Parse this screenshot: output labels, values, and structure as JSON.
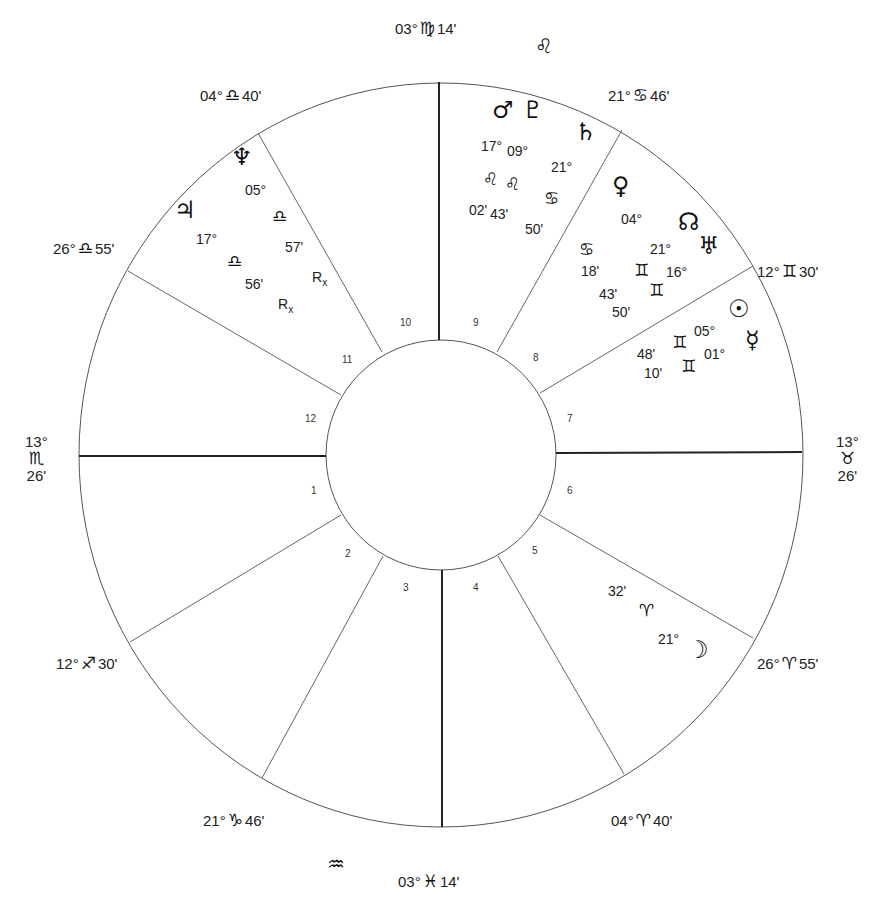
{
  "chart": {
    "type": "natal-wheel",
    "center": {
      "x": 441,
      "y": 455
    },
    "outer_radius": {
      "rx": 362,
      "ry": 372
    },
    "inner_radius": 115,
    "line_color": "#555555",
    "axis_color": "#222222"
  },
  "cusps": [
    {
      "id": "mc",
      "label_deg": "03°",
      "sign": "♍",
      "label_min": "14'",
      "x": 395,
      "y": 20
    },
    {
      "id": "c9",
      "label_deg": "21°",
      "sign": "♋",
      "label_min": "46'",
      "x": 608,
      "y": 87
    },
    {
      "id": "c8",
      "label_deg": "12°",
      "sign": "♊",
      "label_min": "30'",
      "x": 757,
      "y": 263
    },
    {
      "id": "desc",
      "label_deg": "13°",
      "sign": "♉",
      "label_min": "26'",
      "x": 836,
      "y": 433
    },
    {
      "id": "c6",
      "label_deg": "26°",
      "sign": "♈",
      "label_min": "55'",
      "x": 757,
      "y": 655
    },
    {
      "id": "c5",
      "label_deg": "04°",
      "sign": "♈",
      "label_min": "40'",
      "x": 611,
      "y": 812
    },
    {
      "id": "ic",
      "label_deg": "03°",
      "sign": "♓",
      "label_min": "14'",
      "x": 398,
      "y": 873
    },
    {
      "id": "c3",
      "label_deg": "21°",
      "sign": "♑",
      "label_min": "46'",
      "x": 203,
      "y": 812
    },
    {
      "id": "c2",
      "label_deg": "12°",
      "sign": "♐",
      "label_min": "30'",
      "x": 56,
      "y": 655
    },
    {
      "id": "asc",
      "label_deg": "13°",
      "sign": "♏",
      "label_min": "26'",
      "x": 25,
      "y": 433
    },
    {
      "id": "c12",
      "label_deg": "26°",
      "sign": "♎",
      "label_min": "55'",
      "x": 53,
      "y": 240
    },
    {
      "id": "c11",
      "label_deg": "04°",
      "sign": "♎",
      "label_min": "40'",
      "x": 200,
      "y": 87
    }
  ],
  "intercepted_signs": [
    {
      "sign": "♌",
      "x": 535,
      "y": 36
    },
    {
      "sign": "♒",
      "x": 327,
      "y": 854
    }
  ],
  "houses": [
    {
      "n": "1",
      "x": 311,
      "y": 486
    },
    {
      "n": "2",
      "x": 345,
      "y": 549
    },
    {
      "n": "3",
      "x": 403,
      "y": 583
    },
    {
      "n": "4",
      "x": 473,
      "y": 583
    },
    {
      "n": "5",
      "x": 532,
      "y": 546
    },
    {
      "n": "6",
      "x": 567,
      "y": 486
    },
    {
      "n": "7",
      "x": 567,
      "y": 414
    },
    {
      "n": "8",
      "x": 533,
      "y": 353
    },
    {
      "n": "9",
      "x": 473,
      "y": 318
    },
    {
      "n": "10",
      "x": 400,
      "y": 318
    },
    {
      "n": "11",
      "x": 342,
      "y": 355
    },
    {
      "n": "12",
      "x": 305,
      "y": 414
    }
  ],
  "planets": [
    {
      "name": "Mars",
      "glyph": "♂",
      "deg": "17°",
      "sign": "♌",
      "min": "02'",
      "retro": false,
      "g": {
        "x": 502,
        "y": 110
      },
      "d": {
        "x": 493,
        "y": 147
      },
      "s": {
        "x": 492,
        "y": 180
      },
      "m": {
        "x": 481,
        "y": 211
      }
    },
    {
      "name": "Pluto",
      "glyph": "♇",
      "deg": "09°",
      "sign": "♌",
      "min": "43'",
      "retro": false,
      "g": {
        "x": 532,
        "y": 110
      },
      "d": {
        "x": 519,
        "y": 152
      },
      "s": {
        "x": 514,
        "y": 185
      },
      "m": {
        "x": 502,
        "y": 215
      }
    },
    {
      "name": "Saturn",
      "glyph": "♄",
      "deg": "21°",
      "sign": "♋",
      "min": "50'",
      "retro": false,
      "g": {
        "x": 585,
        "y": 132
      },
      "d": {
        "x": 563,
        "y": 168
      },
      "s": {
        "x": 553,
        "y": 199
      },
      "m": {
        "x": 537,
        "y": 230
      }
    },
    {
      "name": "Venus",
      "glyph": "♀",
      "deg": "04°",
      "sign": "♋",
      "min": "18'",
      "retro": false,
      "g": {
        "x": 622,
        "y": 186
      },
      "d": {
        "x": 633,
        "y": 220
      },
      "s": {
        "x": 588,
        "y": 250
      },
      "m": {
        "x": 593,
        "y": 272
      }
    },
    {
      "name": "North Node",
      "glyph": "☊",
      "deg": "21°",
      "sign": "♊",
      "min": "43'",
      "retro": false,
      "g": {
        "x": 688,
        "y": 222
      },
      "d": {
        "x": 662,
        "y": 250
      },
      "s": {
        "x": 643,
        "y": 271
      },
      "m": {
        "x": 611,
        "y": 295
      }
    },
    {
      "name": "Uranus",
      "glyph": "♅",
      "deg": "16°",
      "sign": "♊",
      "min": "50'",
      "retro": false,
      "g": {
        "x": 708,
        "y": 246
      },
      "d": {
        "x": 678,
        "y": 273
      },
      "s": {
        "x": 658,
        "y": 291
      },
      "m": {
        "x": 624,
        "y": 313
      }
    },
    {
      "name": "Sun",
      "glyph": "☉",
      "deg": "05°",
      "sign": "♊",
      "min": "48'",
      "retro": false,
      "g": {
        "x": 738,
        "y": 309
      },
      "d": {
        "x": 706,
        "y": 332
      },
      "s": {
        "x": 681,
        "y": 343
      },
      "m": {
        "x": 649,
        "y": 355
      }
    },
    {
      "name": "Mercury",
      "glyph": "☿",
      "deg": "01°",
      "sign": "♊",
      "min": "10'",
      "retro": false,
      "g": {
        "x": 755,
        "y": 340
      },
      "d": {
        "x": 716,
        "y": 355
      },
      "s": {
        "x": 690,
        "y": 367
      },
      "m": {
        "x": 656,
        "y": 374
      }
    },
    {
      "name": "Moon",
      "glyph": "☽",
      "deg": "21°",
      "sign": "♈",
      "min": "32'",
      "retro": false,
      "g": {
        "x": 697,
        "y": 650
      },
      "d": {
        "x": 670,
        "y": 640
      },
      "s": {
        "x": 648,
        "y": 611
      },
      "m": {
        "x": 620,
        "y": 592
      }
    },
    {
      "name": "Neptune",
      "glyph": "♆",
      "deg": "05°",
      "sign": "♎",
      "min": "57'",
      "retro": true,
      "rx_label": "R",
      "g": {
        "x": 241,
        "y": 157
      },
      "d": {
        "x": 257,
        "y": 191
      },
      "s": {
        "x": 281,
        "y": 217
      },
      "m": {
        "x": 297,
        "y": 248
      },
      "r": {
        "x": 320,
        "y": 278
      }
    },
    {
      "name": "Jupiter",
      "glyph": "♃",
      "deg": "17°",
      "sign": "♎",
      "min": "56'",
      "retro": true,
      "rx_label": "R",
      "g": {
        "x": 184,
        "y": 210
      },
      "d": {
        "x": 208,
        "y": 240
      },
      "s": {
        "x": 236,
        "y": 262
      },
      "m": {
        "x": 257,
        "y": 285
      },
      "r": {
        "x": 286,
        "y": 305
      }
    }
  ]
}
